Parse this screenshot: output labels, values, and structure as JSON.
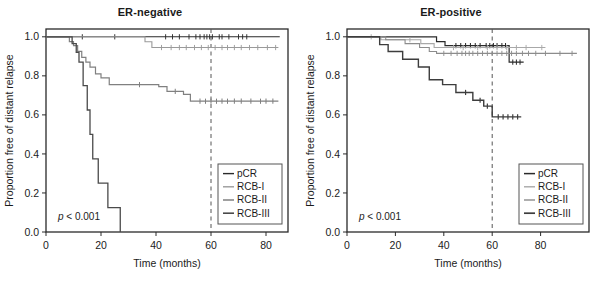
{
  "figure": {
    "width": 601,
    "height": 283,
    "background": "#ffffff"
  },
  "chart_data": [
    {
      "type": "line",
      "id": "er-negative",
      "title": "ER-negative",
      "xlabel": "Time (months)",
      "ylabel": "Proportion free of distant relapse",
      "xlim": [
        0,
        88
      ],
      "ylim": [
        0.0,
        1.04
      ],
      "xticks": [
        0,
        20,
        40,
        60,
        80
      ],
      "xtick_labels": [
        "0",
        "20",
        "40",
        "60",
        "80"
      ],
      "yticks": [
        0.0,
        0.2,
        0.4,
        0.6,
        0.8,
        1.0
      ],
      "ytick_labels": [
        "0.0",
        "0.2",
        "0.4",
        "0.6",
        "0.8",
        "1.0"
      ],
      "grid": false,
      "annotation": "p < 0.001",
      "annotation_p": "p",
      "annotation_rest": " < 0.001",
      "reference_line": {
        "x": 60,
        "style": "dashed",
        "color": "#555555"
      },
      "legend_position": "bottom-right",
      "legend_entries": [
        "pCR",
        "RCB-I",
        "RCB-II",
        "RCB-III"
      ],
      "series": [
        {
          "name": "pCR",
          "color": "#2a2a2a",
          "width": 1.1,
          "steps": [
            [
              0,
              1.0
            ],
            [
              85,
              1.0
            ]
          ],
          "censor_marks": [
            [
              13.2,
              1.0
            ],
            [
              25.0,
              1.0
            ],
            [
              43.5,
              1.0
            ],
            [
              46.0,
              1.0
            ],
            [
              48.5,
              1.0
            ],
            [
              52.0,
              1.0
            ],
            [
              54.5,
              1.0
            ],
            [
              56.0,
              1.0
            ],
            [
              57.5,
              1.0
            ],
            [
              58.5,
              1.0
            ],
            [
              59.5,
              1.0
            ],
            [
              60.5,
              1.0
            ],
            [
              63.0,
              1.0
            ],
            [
              64.0,
              1.0
            ],
            [
              66.5,
              1.0
            ],
            [
              70.0,
              1.0
            ],
            [
              71.5,
              1.0
            ],
            [
              73.0,
              1.0
            ]
          ]
        },
        {
          "name": "RCB-I",
          "color": "#9a9a9a",
          "width": 1.1,
          "steps": [
            [
              0,
              1.0
            ],
            [
              36.0,
              1.0
            ],
            [
              36.0,
              0.975
            ],
            [
              38.5,
              0.975
            ],
            [
              38.5,
              0.945
            ],
            [
              84.5,
              0.945
            ]
          ],
          "censor_marks": [
            [
              42.0,
              0.945
            ],
            [
              45.5,
              0.945
            ],
            [
              48.5,
              0.945
            ],
            [
              51.0,
              0.945
            ],
            [
              54.0,
              0.945
            ],
            [
              56.5,
              0.945
            ],
            [
              59.0,
              0.945
            ],
            [
              61.5,
              0.945
            ],
            [
              64.0,
              0.945
            ],
            [
              66.0,
              0.945
            ],
            [
              68.5,
              0.945
            ],
            [
              71.0,
              0.945
            ],
            [
              74.0,
              0.945
            ],
            [
              77.0,
              0.945
            ],
            [
              80.5,
              0.945
            ],
            [
              83.5,
              0.945
            ]
          ]
        },
        {
          "name": "RCB-II",
          "color": "#808080",
          "width": 1.2,
          "steps": [
            [
              0,
              1.0
            ],
            [
              8.5,
              1.0
            ],
            [
              8.5,
              0.975
            ],
            [
              10.0,
              0.975
            ],
            [
              10.0,
              0.955
            ],
            [
              11.5,
              0.955
            ],
            [
              11.5,
              0.925
            ],
            [
              13.0,
              0.925
            ],
            [
              13.0,
              0.895
            ],
            [
              14.5,
              0.895
            ],
            [
              14.5,
              0.87
            ],
            [
              16.0,
              0.87
            ],
            [
              16.0,
              0.845
            ],
            [
              18.0,
              0.845
            ],
            [
              18.0,
              0.81
            ],
            [
              20.0,
              0.81
            ],
            [
              20.0,
              0.79
            ],
            [
              23.0,
              0.79
            ],
            [
              23.0,
              0.755
            ],
            [
              41.0,
              0.755
            ],
            [
              41.0,
              0.745
            ],
            [
              44.0,
              0.745
            ],
            [
              44.0,
              0.72
            ],
            [
              50.0,
              0.72
            ],
            [
              50.0,
              0.705
            ],
            [
              52.5,
              0.705
            ],
            [
              52.5,
              0.67
            ],
            [
              84.5,
              0.67
            ]
          ],
          "censor_marks": [
            [
              34.0,
              0.755
            ],
            [
              47.0,
              0.72
            ],
            [
              56.0,
              0.67
            ],
            [
              58.0,
              0.67
            ],
            [
              60.0,
              0.67
            ],
            [
              62.0,
              0.67
            ],
            [
              64.0,
              0.67
            ],
            [
              66.0,
              0.67
            ],
            [
              68.5,
              0.67
            ],
            [
              71.0,
              0.67
            ],
            [
              74.5,
              0.67
            ],
            [
              78.0,
              0.67
            ],
            [
              80.0,
              0.67
            ],
            [
              82.5,
              0.67
            ]
          ]
        },
        {
          "name": "RCB-III",
          "color": "#4a4a4a",
          "width": 1.3,
          "steps": [
            [
              0,
              1.0
            ],
            [
              9.5,
              1.0
            ],
            [
              9.5,
              0.965
            ],
            [
              11.0,
              0.965
            ],
            [
              11.0,
              0.92
            ],
            [
              12.0,
              0.92
            ],
            [
              12.0,
              0.87
            ],
            [
              13.5,
              0.87
            ],
            [
              13.5,
              0.75
            ],
            [
              15.0,
              0.75
            ],
            [
              15.0,
              0.625
            ],
            [
              16.0,
              0.625
            ],
            [
              16.0,
              0.5
            ],
            [
              17.0,
              0.5
            ],
            [
              17.0,
              0.375
            ],
            [
              19.0,
              0.375
            ],
            [
              19.0,
              0.25
            ],
            [
              22.5,
              0.25
            ],
            [
              22.5,
              0.125
            ],
            [
              27.0,
              0.125
            ],
            [
              27.0,
              0.0
            ]
          ],
          "censor_marks": []
        }
      ]
    },
    {
      "type": "line",
      "id": "er-positive",
      "title": "ER-positive",
      "xlabel": "Time (months)",
      "ylabel": "Proportion free of distant relapse",
      "xlim": [
        0,
        100
      ],
      "ylim": [
        0.0,
        1.04
      ],
      "xticks": [
        0,
        20,
        40,
        60,
        80
      ],
      "xtick_labels": [
        "0",
        "20",
        "40",
        "60",
        "80"
      ],
      "yticks": [
        0.0,
        0.2,
        0.4,
        0.6,
        0.8,
        1.0
      ],
      "ytick_labels": [
        "0.0",
        "0.2",
        "0.4",
        "0.6",
        "0.8",
        "1.0"
      ],
      "grid": false,
      "annotation": "p < 0.001",
      "annotation_p": "p",
      "annotation_rest": " < 0.001",
      "reference_line": {
        "x": 60,
        "style": "dashed",
        "color": "#555555"
      },
      "legend_position": "bottom-right",
      "legend_entries": [
        "pCR",
        "RCB-I",
        "RCB-II",
        "RCB-III"
      ],
      "series": [
        {
          "name": "pCR",
          "color": "#2a2a2a",
          "width": 1.2,
          "steps": [
            [
              0,
              1.0
            ],
            [
              37.0,
              1.0
            ],
            [
              37.0,
              0.975
            ],
            [
              40.5,
              0.975
            ],
            [
              40.5,
              0.955
            ],
            [
              67.0,
              0.955
            ],
            [
              67.0,
              0.87
            ],
            [
              73.0,
              0.87
            ]
          ],
          "censor_marks": [
            [
              45.0,
              0.955
            ],
            [
              47.0,
              0.955
            ],
            [
              49.0,
              0.955
            ],
            [
              51.0,
              0.955
            ],
            [
              53.0,
              0.955
            ],
            [
              55.0,
              0.955
            ],
            [
              57.5,
              0.955
            ],
            [
              59.0,
              0.955
            ],
            [
              60.5,
              0.955
            ],
            [
              62.0,
              0.955
            ],
            [
              64.0,
              0.955
            ],
            [
              65.5,
              0.955
            ],
            [
              68.5,
              0.87
            ],
            [
              70.0,
              0.87
            ],
            [
              71.5,
              0.87
            ]
          ]
        },
        {
          "name": "RCB-I",
          "color": "#a8a8a8",
          "width": 1.1,
          "steps": [
            [
              0,
              1.0
            ],
            [
              14.0,
              1.0
            ],
            [
              14.0,
              0.985
            ],
            [
              30.5,
              0.985
            ],
            [
              30.5,
              0.965
            ],
            [
              36.0,
              0.965
            ],
            [
              36.0,
              0.945
            ],
            [
              82.0,
              0.945
            ]
          ],
          "censor_marks": [
            [
              10.0,
              1.0
            ],
            [
              26.0,
              0.985
            ],
            [
              44.0,
              0.945
            ],
            [
              48.0,
              0.945
            ],
            [
              54.0,
              0.945
            ],
            [
              58.0,
              0.945
            ],
            [
              62.0,
              0.945
            ],
            [
              66.0,
              0.945
            ],
            [
              70.0,
              0.945
            ],
            [
              74.0,
              0.945
            ],
            [
              80.5,
              0.945
            ]
          ]
        },
        {
          "name": "RCB-II",
          "color": "#8c8c8c",
          "width": 1.1,
          "steps": [
            [
              0,
              1.0
            ],
            [
              16.0,
              1.0
            ],
            [
              16.0,
              0.985
            ],
            [
              24.0,
              0.985
            ],
            [
              24.0,
              0.965
            ],
            [
              30.0,
              0.965
            ],
            [
              30.0,
              0.945
            ],
            [
              34.0,
              0.945
            ],
            [
              34.0,
              0.925
            ],
            [
              37.0,
              0.925
            ],
            [
              37.0,
              0.915
            ],
            [
              95.0,
              0.915
            ]
          ],
          "censor_marks": [
            [
              40.0,
              0.915
            ],
            [
              43.0,
              0.915
            ],
            [
              45.5,
              0.915
            ],
            [
              47.5,
              0.915
            ],
            [
              49.0,
              0.915
            ],
            [
              50.5,
              0.915
            ],
            [
              52.0,
              0.915
            ],
            [
              54.0,
              0.915
            ],
            [
              56.0,
              0.915
            ],
            [
              58.0,
              0.915
            ],
            [
              60.0,
              0.915
            ],
            [
              62.0,
              0.915
            ],
            [
              64.0,
              0.915
            ],
            [
              66.0,
              0.915
            ],
            [
              68.0,
              0.915
            ],
            [
              70.0,
              0.915
            ],
            [
              72.5,
              0.915
            ],
            [
              75.0,
              0.915
            ],
            [
              78.0,
              0.915
            ],
            [
              82.0,
              0.915
            ],
            [
              88.0,
              0.915
            ],
            [
              93.0,
              0.915
            ]
          ]
        },
        {
          "name": "RCB-III",
          "color": "#3d3d3d",
          "width": 1.4,
          "steps": [
            [
              0,
              1.0
            ],
            [
              13.5,
              1.0
            ],
            [
              13.5,
              0.96
            ],
            [
              17.0,
              0.96
            ],
            [
              17.0,
              0.925
            ],
            [
              23.0,
              0.925
            ],
            [
              23.0,
              0.885
            ],
            [
              29.5,
              0.885
            ],
            [
              29.5,
              0.845
            ],
            [
              34.0,
              0.845
            ],
            [
              34.0,
              0.78
            ],
            [
              39.5,
              0.78
            ],
            [
              39.5,
              0.755
            ],
            [
              45.0,
              0.755
            ],
            [
              45.0,
              0.715
            ],
            [
              52.0,
              0.715
            ],
            [
              52.0,
              0.675
            ],
            [
              56.5,
              0.675
            ],
            [
              56.5,
              0.645
            ],
            [
              60.0,
              0.645
            ],
            [
              60.0,
              0.59
            ],
            [
              72.0,
              0.59
            ]
          ],
          "censor_marks": [
            [
              49.0,
              0.715
            ],
            [
              55.0,
              0.675
            ],
            [
              58.0,
              0.645
            ],
            [
              62.5,
              0.59
            ],
            [
              64.5,
              0.59
            ],
            [
              66.5,
              0.59
            ],
            [
              68.5,
              0.59
            ],
            [
              70.5,
              0.59
            ]
          ]
        }
      ]
    }
  ]
}
